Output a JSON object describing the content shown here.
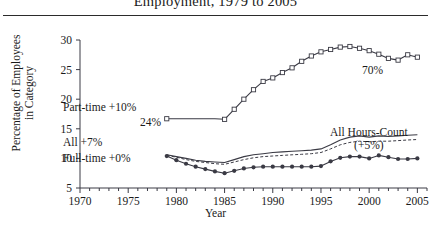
{
  "title": "Employment, 1979 to 2005",
  "axis": {
    "ylabel_line1": "Percentage of Employees",
    "ylabel_line2": "in Category",
    "xlabel": "Year",
    "yticks": [
      5,
      10,
      15,
      20,
      25,
      30
    ],
    "xticks": [
      1970,
      1975,
      1980,
      1985,
      1990,
      1995,
      2000,
      2005
    ]
  },
  "annotations": {
    "part_time": "Part-time +10%",
    "part_time_value": "24%",
    "all": "All +7%",
    "full_time": "Full-time +0%",
    "part_time_end": "70%",
    "hours_count_line1": "All Hours-Count",
    "hours_count_line2": "(+5%)"
  },
  "colors": {
    "line": "#3a3a44",
    "text": "#1a1a1a",
    "rule": "#2b2b2b",
    "background": "#ffffff"
  },
  "chart_data": {
    "type": "line",
    "title": "Employment, 1979 to 2005",
    "xlabel": "Year",
    "ylabel": "Percentage of Employees in Category",
    "xlim": [
      1970,
      2006
    ],
    "ylim": [
      5,
      30
    ],
    "grid": false,
    "legend": "annotations-inline",
    "x": [
      1979,
      1980,
      1981,
      1982,
      1983,
      1984,
      1985,
      1986,
      1987,
      1988,
      1989,
      1990,
      1991,
      1992,
      1993,
      1994,
      1995,
      1996,
      1997,
      1998,
      1999,
      2000,
      2001,
      2002,
      2003,
      2004,
      2005
    ],
    "series": [
      {
        "name": "Part-time",
        "marker": "open-square",
        "style": "solid",
        "label": "Part-time +10%",
        "start_label": "24%",
        "end_label": "70%",
        "values": [
          16.7,
          16.7,
          16.7,
          16.7,
          16.7,
          16.7,
          16.6,
          18.3,
          20.0,
          21.6,
          23.0,
          23.6,
          24.5,
          25.3,
          26.4,
          27.3,
          28.0,
          28.4,
          28.8,
          28.9,
          28.6,
          28.2,
          27.6,
          26.9,
          26.6,
          27.5,
          27.1
        ]
      },
      {
        "name": "All",
        "marker": "none",
        "style": "solid",
        "label": "All +7%",
        "values": [
          10.6,
          10.3,
          10.0,
          9.7,
          9.5,
          9.4,
          9.3,
          9.8,
          10.3,
          10.6,
          10.8,
          11.0,
          11.1,
          11.2,
          11.3,
          11.4,
          11.6,
          12.3,
          13.1,
          13.6,
          13.8,
          13.6,
          13.8,
          13.7,
          13.8,
          13.9,
          14.0
        ]
      },
      {
        "name": "All Hours-Count",
        "marker": "none",
        "style": "dashed",
        "label": "All Hours-Count (+5%)",
        "values": [
          10.5,
          10.2,
          9.8,
          9.5,
          9.3,
          9.1,
          9.0,
          9.4,
          9.8,
          10.1,
          10.3,
          10.4,
          10.5,
          10.6,
          10.7,
          10.8,
          11.0,
          11.6,
          12.3,
          12.7,
          12.9,
          12.8,
          12.9,
          12.9,
          13.0,
          13.1,
          13.2
        ]
      },
      {
        "name": "Full-time",
        "marker": "filled-circle",
        "style": "solid",
        "label": "Full-time +0%",
        "values": [
          10.4,
          9.7,
          9.1,
          8.6,
          8.2,
          7.8,
          7.5,
          7.9,
          8.3,
          8.5,
          8.6,
          8.6,
          8.6,
          8.6,
          8.6,
          8.6,
          8.7,
          9.5,
          10.1,
          10.3,
          10.3,
          10.0,
          10.5,
          10.2,
          9.9,
          9.9,
          10.0
        ]
      }
    ]
  }
}
